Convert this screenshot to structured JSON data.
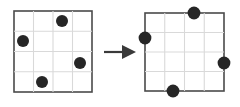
{
  "figure": {
    "type": "diagram",
    "title": "",
    "caption": "",
    "background_color": "#ffffff",
    "width": 240,
    "height": 107
  },
  "colors": {
    "dot": "#262626",
    "grid_border": "#4a4a4a",
    "grid_inner_line": "#d9d9d9",
    "arrow": "#3a3a3a",
    "background": "#ffffff"
  },
  "panels": [
    {
      "id": "left-grid",
      "name": "source-grid",
      "label": "",
      "rows": 4,
      "columns": 4,
      "box": {
        "x": 14,
        "y": 11,
        "width": 78,
        "height": 81
      },
      "inner_lines": {
        "vertical_fractions": [
          0.25,
          0.5,
          0.75
        ],
        "horizontal_fractions": [
          0.25,
          0.5,
          0.75
        ]
      },
      "dots": [
        {
          "id": "dot-a",
          "name": "dot-top",
          "cell_col": 3,
          "cell_row": 1,
          "cx": 62,
          "cy": 21,
          "r": 6.0
        },
        {
          "id": "dot-b",
          "name": "dot-left",
          "cell_col": 1,
          "cell_row": 2,
          "cx": 23,
          "cy": 41,
          "r": 6.0
        },
        {
          "id": "dot-c",
          "name": "dot-right",
          "cell_col": 4,
          "cell_row": 3,
          "cx": 80,
          "cy": 63,
          "r": 6.0
        },
        {
          "id": "dot-d",
          "name": "dot-bottom",
          "cell_col": 2,
          "cell_row": 4,
          "cx": 42,
          "cy": 82,
          "r": 6.0
        }
      ]
    },
    {
      "id": "right-grid",
      "name": "result-grid",
      "label": "",
      "rows": 4,
      "columns": 4,
      "box": {
        "x": 145,
        "y": 13,
        "width": 79,
        "height": 78
      },
      "inner_lines": {
        "vertical_fractions": [
          0.25,
          0.5,
          0.75
        ],
        "horizontal_fractions": [
          0.25,
          0.5,
          0.75
        ]
      },
      "dots": [
        {
          "id": "dot-a2",
          "name": "dot-top-edge",
          "edge": "top",
          "cx": 194,
          "cy": 13,
          "r": 6.4
        },
        {
          "id": "dot-b2",
          "name": "dot-left-edge",
          "edge": "left",
          "cx": 145,
          "cy": 38,
          "r": 6.4
        },
        {
          "id": "dot-c2",
          "name": "dot-right-edge",
          "edge": "right",
          "cx": 224,
          "cy": 63,
          "r": 6.4
        },
        {
          "id": "dot-d2",
          "name": "dot-bottom-edge",
          "edge": "bottom",
          "cx": 173,
          "cy": 91,
          "r": 6.4
        }
      ]
    }
  ],
  "arrow": {
    "name": "transformation-arrow",
    "label": "",
    "direction": "right",
    "shaft": {
      "x1": 104,
      "y1": 52,
      "x2": 124,
      "y2": 52
    },
    "head": {
      "points": "122,45 136,52 122,59"
    }
  }
}
